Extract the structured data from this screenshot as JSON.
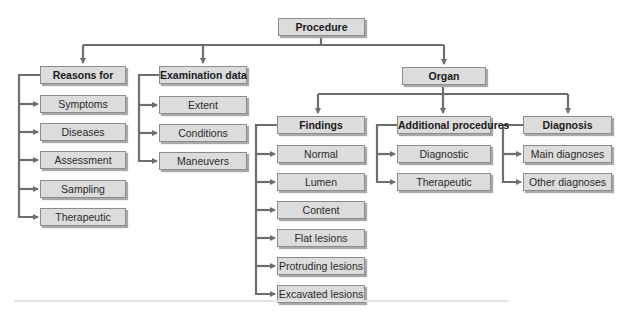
{
  "root": {
    "label": "Procedure"
  },
  "branches": [
    {
      "label": "Reasons for",
      "children": [
        "Symptoms",
        "Diseases",
        "Assessment",
        "Sampling",
        "Therapeutic"
      ]
    },
    {
      "label": "Examination data",
      "children": [
        "Extent",
        "Conditions",
        "Maneuvers"
      ]
    },
    {
      "label": "Organ",
      "sub_branches": [
        {
          "label": "Findings",
          "children": [
            "Normal",
            "Lumen",
            "Content",
            "Flat lesions",
            "Protruding lesions",
            "Excavated lesions"
          ]
        },
        {
          "label": "Additional procedures",
          "children": [
            "Diagnostic",
            "Therapeutic"
          ]
        },
        {
          "label": "Diagnosis",
          "children": [
            "Main diagnoses",
            "Other diagnoses"
          ]
        }
      ]
    }
  ],
  "colors": {
    "box_fill": "#dcdcdc",
    "box_border": "#8c8c8c",
    "connector": "#6e6e6e"
  }
}
